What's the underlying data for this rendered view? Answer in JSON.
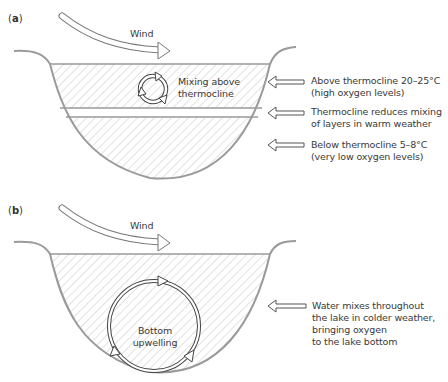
{
  "panel_a": {
    "label_open": "(",
    "label_letter": "a",
    "label_close": ")",
    "wind_label": "Wind",
    "mixing_label_line1": "Mixing above",
    "mixing_label_line2": "thermocline",
    "annotations": [
      {
        "line1": "Above thermocline 20–25°C",
        "line2": "(high oxygen levels)"
      },
      {
        "line1": "Thermocline reduces mixing",
        "line2": "of layers in warm weather"
      },
      {
        "line1": "Below thermocline 5–8°C",
        "line2": "(very low oxygen levels)"
      }
    ]
  },
  "panel_b": {
    "label_open": "(",
    "label_letter": "b",
    "label_close": ")",
    "wind_label": "Wind",
    "upwelling_label_line1": "Bottom",
    "upwelling_label_line2": "upwelling",
    "annotation": {
      "line1": "Water mixes throughout",
      "line2": "the lake in colder weather,",
      "line3": "bringing oxygen",
      "line4": "to the lake bottom"
    }
  },
  "colors": {
    "outline": "#9a9a9a",
    "hatch": "#c4c4c4",
    "arrow_stroke": "#555555",
    "text": "#3a3a3a"
  }
}
